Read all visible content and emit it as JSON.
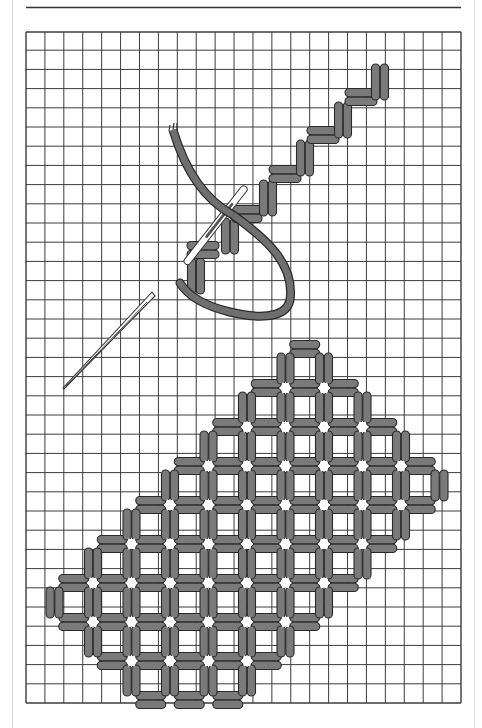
{
  "figure": {
    "title": "",
    "colors": {
      "stitch_fill": "#7a7a7a",
      "stitch_outline": "#2a2a2a",
      "thread": "#6f6f6f",
      "grid_line": "#3c3c3c",
      "background": "#ffffff",
      "needle_fill": "#ffffff",
      "hole": "#ffffff"
    },
    "grid": {
      "columns": 23,
      "rows": 35
    },
    "staircase": {
      "description": "Working row: alternating horizontal and vertical stitch pairs climbing diagonally up-right",
      "steps": [
        {
          "orientation": "vertical",
          "col": 9,
          "row": 11
        },
        {
          "orientation": "horizontal",
          "col": 9,
          "row": 11
        },
        {
          "orientation": "vertical",
          "col": 11,
          "row": 10
        },
        {
          "orientation": "horizontal",
          "col": 11,
          "row": 9
        },
        {
          "orientation": "vertical",
          "col": 13,
          "row": 7
        },
        {
          "orientation": "horizontal",
          "col": 13,
          "row": 7
        },
        {
          "orientation": "vertical",
          "col": 15,
          "row": 5
        },
        {
          "orientation": "horizontal",
          "col": 15,
          "row": 5
        },
        {
          "orientation": "vertical",
          "col": 17,
          "row": 3
        },
        {
          "orientation": "horizontal",
          "col": 17,
          "row": 3
        },
        {
          "orientation": "vertical",
          "col": 19,
          "row": 1
        }
      ]
    },
    "needles": [
      {
        "name": "working-needle",
        "state": "inserted through stitches, thread attached"
      },
      {
        "name": "loose-needle",
        "state": "lying diagonally, point lower-left"
      }
    ],
    "lattice": {
      "description": "Completed trellis: pairs of straight stitches forming squares, white star holes at crossings",
      "holes": [
        [
          5,
          0
        ],
        [
          6,
          0
        ],
        [
          4,
          1
        ],
        [
          5,
          1
        ],
        [
          6,
          1
        ],
        [
          7,
          1
        ],
        [
          3,
          2
        ],
        [
          4,
          2
        ],
        [
          5,
          2
        ],
        [
          6,
          2
        ],
        [
          7,
          2
        ],
        [
          8,
          2
        ],
        [
          2,
          3
        ],
        [
          3,
          3
        ],
        [
          4,
          3
        ],
        [
          5,
          3
        ],
        [
          6,
          3
        ],
        [
          7,
          3
        ],
        [
          8,
          3
        ],
        [
          1,
          4
        ],
        [
          2,
          4
        ],
        [
          3,
          4
        ],
        [
          4,
          4
        ],
        [
          5,
          4
        ],
        [
          6,
          4
        ],
        [
          7,
          4
        ],
        [
          0,
          5
        ],
        [
          1,
          5
        ],
        [
          2,
          5
        ],
        [
          3,
          5
        ],
        [
          4,
          5
        ],
        [
          5,
          5
        ],
        [
          6,
          5
        ],
        [
          0,
          6
        ],
        [
          1,
          6
        ],
        [
          2,
          6
        ],
        [
          3,
          6
        ],
        [
          4,
          6
        ],
        [
          5,
          6
        ],
        [
          1,
          7
        ],
        [
          2,
          7
        ],
        [
          3,
          7
        ],
        [
          4,
          7
        ]
      ]
    }
  }
}
